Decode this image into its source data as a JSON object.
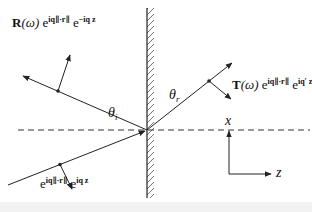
{
  "diagram": {
    "type": "reflection-transmission-at-interface",
    "reflected_label": {
      "prefix": "R",
      "arg": "(ω)",
      "exp1_base": "e",
      "exp1": "iq∥·r∥",
      "exp2_base": "e",
      "exp2": "−iq z"
    },
    "transmitted_label": {
      "prefix": "T",
      "arg": "(ω)",
      "exp1_base": "e",
      "exp1": "iq∥·r∥",
      "exp2_base": "e",
      "exp2": "iq′ z"
    },
    "incident_label": {
      "exp1_base": "e",
      "exp1": "iq∥·r∥",
      "exp2_base": "e",
      "exp2": "iq z"
    },
    "angle_incident": {
      "symbol": "θ",
      "sub": "i"
    },
    "angle_refracted": {
      "symbol": "θ",
      "sub": "r"
    },
    "axes": {
      "vertical": "x",
      "horizontal": "z"
    },
    "colors": {
      "line": "#222222",
      "background": "#ffffff"
    }
  }
}
